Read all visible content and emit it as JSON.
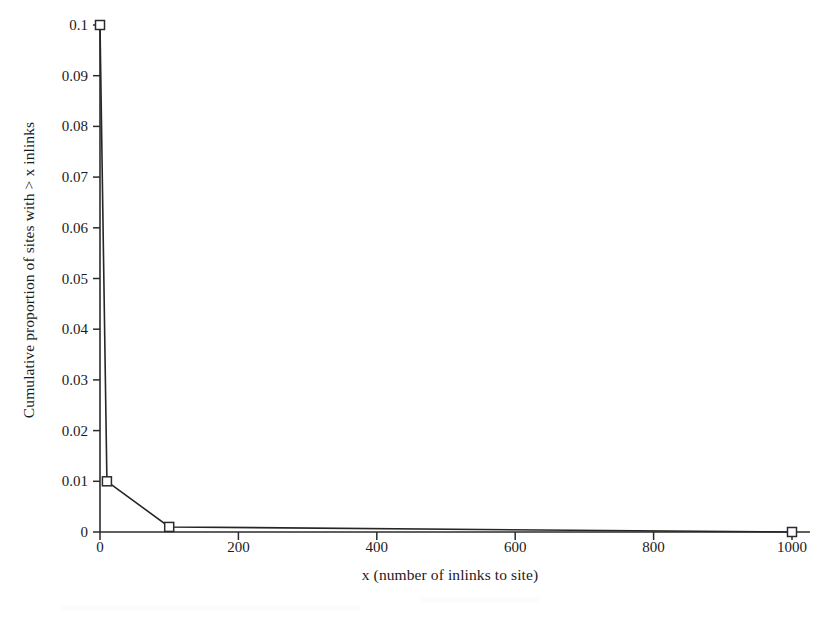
{
  "chart_data": {
    "type": "line",
    "title": "",
    "xlabel": "x (number of inlinks to site)",
    "ylabel": "Cumulative proportion of sites with > x inlinks",
    "xlim": [
      0,
      1000
    ],
    "ylim": [
      0,
      0.1
    ],
    "grid": false,
    "legend": null,
    "marker": "open-square",
    "x": [
      0,
      10,
      100,
      1000
    ],
    "y": [
      0.1,
      0.01,
      0.001,
      0.0
    ],
    "series": [
      {
        "name": "Cumulative proportion of sites with > x inlinks",
        "points": [
          {
            "x": 0,
            "y": 0.1
          },
          {
            "x": 10,
            "y": 0.01
          },
          {
            "x": 100,
            "y": 0.001
          },
          {
            "x": 1000,
            "y": 0.0
          }
        ]
      }
    ],
    "xticks": [
      0,
      200,
      400,
      600,
      800,
      1000
    ],
    "xtick_labels": [
      "0",
      "200",
      "400",
      "600",
      "800",
      "1000"
    ],
    "yticks": [
      0,
      0.01,
      0.02,
      0.03,
      0.04,
      0.05,
      0.06,
      0.07,
      0.08,
      0.09,
      0.1
    ],
    "ytick_labels": [
      "0",
      "0.01",
      "0.02",
      "0.03",
      "0.04",
      "0.05",
      "0.06",
      "0.07",
      "0.08",
      "0.09",
      "0.1"
    ],
    "colors": {
      "background": "#ffffff",
      "axis": "#2b2b2b",
      "line": "#262626",
      "marker_edge": "#2b2b2b",
      "marker_face": "#ffffff",
      "text": "#1b1b1b"
    }
  }
}
